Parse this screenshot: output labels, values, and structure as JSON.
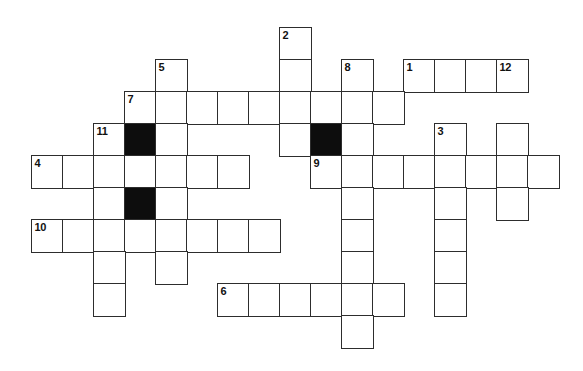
{
  "page": {
    "background_color": "#ffffff"
  },
  "puzzle": {
    "type": "crossword-grid",
    "grid": {
      "origin_x": 31,
      "origin_y": 27,
      "cell_width": 31,
      "cell_height": 32,
      "line_color": "#2d2d2d",
      "white_cell_color": "#ffffff",
      "black_cell_color": "#0d0d0d",
      "number_color": "#111111"
    },
    "clue_numbers_visible": [
      "1",
      "2",
      "3",
      "4",
      "5",
      "6",
      "7",
      "8",
      "9",
      "10",
      "11",
      "12"
    ],
    "cells": [
      {
        "col": 8,
        "row": 0,
        "black": false,
        "number": "2"
      },
      {
        "col": 4,
        "row": 1,
        "black": false,
        "number": "5"
      },
      {
        "col": 8,
        "row": 1,
        "black": false,
        "number": ""
      },
      {
        "col": 10,
        "row": 1,
        "black": false,
        "number": "8"
      },
      {
        "col": 12,
        "row": 1,
        "black": false,
        "number": "1"
      },
      {
        "col": 13,
        "row": 1,
        "black": false,
        "number": ""
      },
      {
        "col": 14,
        "row": 1,
        "black": false,
        "number": ""
      },
      {
        "col": 15,
        "row": 1,
        "black": false,
        "number": "12"
      },
      {
        "col": 3,
        "row": 2,
        "black": false,
        "number": "7"
      },
      {
        "col": 4,
        "row": 2,
        "black": false,
        "number": ""
      },
      {
        "col": 5,
        "row": 2,
        "black": false,
        "number": ""
      },
      {
        "col": 6,
        "row": 2,
        "black": false,
        "number": ""
      },
      {
        "col": 7,
        "row": 2,
        "black": false,
        "number": ""
      },
      {
        "col": 8,
        "row": 2,
        "black": false,
        "number": ""
      },
      {
        "col": 9,
        "row": 2,
        "black": false,
        "number": ""
      },
      {
        "col": 10,
        "row": 2,
        "black": false,
        "number": ""
      },
      {
        "col": 11,
        "row": 2,
        "black": false,
        "number": ""
      },
      {
        "col": 2,
        "row": 3,
        "black": false,
        "number": "11"
      },
      {
        "col": 3,
        "row": 3,
        "black": true,
        "number": ""
      },
      {
        "col": 4,
        "row": 3,
        "black": false,
        "number": ""
      },
      {
        "col": 8,
        "row": 3,
        "black": false,
        "number": ""
      },
      {
        "col": 9,
        "row": 3,
        "black": true,
        "number": ""
      },
      {
        "col": 10,
        "row": 3,
        "black": false,
        "number": ""
      },
      {
        "col": 13,
        "row": 3,
        "black": false,
        "number": "3"
      },
      {
        "col": 15,
        "row": 3,
        "black": false,
        "number": ""
      },
      {
        "col": 0,
        "row": 4,
        "black": false,
        "number": "4"
      },
      {
        "col": 1,
        "row": 4,
        "black": false,
        "number": ""
      },
      {
        "col": 2,
        "row": 4,
        "black": false,
        "number": ""
      },
      {
        "col": 3,
        "row": 4,
        "black": false,
        "number": ""
      },
      {
        "col": 4,
        "row": 4,
        "black": false,
        "number": ""
      },
      {
        "col": 5,
        "row": 4,
        "black": false,
        "number": ""
      },
      {
        "col": 6,
        "row": 4,
        "black": false,
        "number": ""
      },
      {
        "col": 9,
        "row": 4,
        "black": false,
        "number": "9"
      },
      {
        "col": 10,
        "row": 4,
        "black": false,
        "number": ""
      },
      {
        "col": 11,
        "row": 4,
        "black": false,
        "number": ""
      },
      {
        "col": 12,
        "row": 4,
        "black": false,
        "number": ""
      },
      {
        "col": 13,
        "row": 4,
        "black": false,
        "number": ""
      },
      {
        "col": 14,
        "row": 4,
        "black": false,
        "number": ""
      },
      {
        "col": 15,
        "row": 4,
        "black": false,
        "number": ""
      },
      {
        "col": 16,
        "row": 4,
        "black": false,
        "number": ""
      },
      {
        "col": 2,
        "row": 5,
        "black": false,
        "number": ""
      },
      {
        "col": 3,
        "row": 5,
        "black": true,
        "number": ""
      },
      {
        "col": 4,
        "row": 5,
        "black": false,
        "number": ""
      },
      {
        "col": 10,
        "row": 5,
        "black": false,
        "number": ""
      },
      {
        "col": 13,
        "row": 5,
        "black": false,
        "number": ""
      },
      {
        "col": 15,
        "row": 5,
        "black": false,
        "number": ""
      },
      {
        "col": 0,
        "row": 6,
        "black": false,
        "number": "10"
      },
      {
        "col": 1,
        "row": 6,
        "black": false,
        "number": ""
      },
      {
        "col": 2,
        "row": 6,
        "black": false,
        "number": ""
      },
      {
        "col": 3,
        "row": 6,
        "black": false,
        "number": ""
      },
      {
        "col": 4,
        "row": 6,
        "black": false,
        "number": ""
      },
      {
        "col": 5,
        "row": 6,
        "black": false,
        "number": ""
      },
      {
        "col": 6,
        "row": 6,
        "black": false,
        "number": ""
      },
      {
        "col": 7,
        "row": 6,
        "black": false,
        "number": ""
      },
      {
        "col": 10,
        "row": 6,
        "black": false,
        "number": ""
      },
      {
        "col": 13,
        "row": 6,
        "black": false,
        "number": ""
      },
      {
        "col": 2,
        "row": 7,
        "black": false,
        "number": ""
      },
      {
        "col": 4,
        "row": 7,
        "black": false,
        "number": ""
      },
      {
        "col": 10,
        "row": 7,
        "black": false,
        "number": ""
      },
      {
        "col": 13,
        "row": 7,
        "black": false,
        "number": ""
      },
      {
        "col": 2,
        "row": 8,
        "black": false,
        "number": ""
      },
      {
        "col": 6,
        "row": 8,
        "black": false,
        "number": "6"
      },
      {
        "col": 7,
        "row": 8,
        "black": false,
        "number": ""
      },
      {
        "col": 8,
        "row": 8,
        "black": false,
        "number": ""
      },
      {
        "col": 9,
        "row": 8,
        "black": false,
        "number": ""
      },
      {
        "col": 10,
        "row": 8,
        "black": false,
        "number": ""
      },
      {
        "col": 11,
        "row": 8,
        "black": false,
        "number": ""
      },
      {
        "col": 13,
        "row": 8,
        "black": false,
        "number": ""
      },
      {
        "col": 10,
        "row": 9,
        "black": false,
        "number": ""
      }
    ]
  }
}
